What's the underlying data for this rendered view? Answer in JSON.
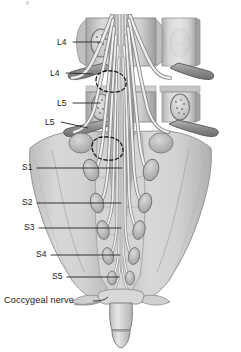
{
  "figure": {
    "type": "anatomical-diagram",
    "region": "lumbosacral spine",
    "background": "#ffffff"
  },
  "palette": {
    "bone_light": "#d2d2d2",
    "bone_mid": "#b9b9b9",
    "bone_dark": "#9a9a9a",
    "bone_shadow": "#7e7e7e",
    "nerve_light": "#efefef",
    "nerve_mid": "#cfcfcf",
    "outline": "#5e5e5e",
    "outline_dark": "#3c3c3c",
    "label_text": "#1a1a1a",
    "leader_line": "#2b2b2b",
    "dashed_disc": "#161616"
  },
  "labels": [
    {
      "id": "l4-body",
      "text": "L4",
      "x": 57,
      "y": 38,
      "leader": {
        "x1": 73,
        "y1": 42,
        "x2": 101,
        "y2": 42
      }
    },
    {
      "id": "l4-nerve",
      "text": "L4",
      "x": 50,
      "y": 69,
      "leader": {
        "x1": 66,
        "y1": 73,
        "x2": 93,
        "y2": 74
      }
    },
    {
      "id": "l5-body",
      "text": "L5",
      "x": 57,
      "y": 99,
      "leader": {
        "x1": 73,
        "y1": 103,
        "x2": 100,
        "y2": 103
      }
    },
    {
      "id": "l5-nerve",
      "text": "L5",
      "x": 45,
      "y": 118,
      "leader": {
        "x1": 61,
        "y1": 122,
        "x2": 88,
        "y2": 128
      }
    },
    {
      "id": "s1",
      "text": "S1",
      "x": 22,
      "y": 163,
      "leader": {
        "x1": 37,
        "y1": 168,
        "x2": 122,
        "y2": 168
      }
    },
    {
      "id": "s2",
      "text": "S2",
      "x": 22,
      "y": 198,
      "leader": {
        "x1": 37,
        "y1": 203,
        "x2": 121,
        "y2": 203
      }
    },
    {
      "id": "s3",
      "text": "S3",
      "x": 24,
      "y": 223,
      "leader": {
        "x1": 39,
        "y1": 228,
        "x2": 121,
        "y2": 228
      }
    },
    {
      "id": "s4",
      "text": "S4",
      "x": 36,
      "y": 250,
      "leader": {
        "x1": 51,
        "y1": 255,
        "x2": 120,
        "y2": 255
      }
    },
    {
      "id": "s5",
      "text": "S5",
      "x": 52,
      "y": 272,
      "leader": {
        "x1": 67,
        "y1": 277,
        "x2": 119,
        "y2": 277
      }
    },
    {
      "id": "coccygeal",
      "text": "Coccygeal nerve",
      "x": 4,
      "y": 297,
      "leader": null
    }
  ],
  "annotations": {
    "dashed_discs": [
      {
        "id": "disc-l4-l5",
        "label": "intervertebral disc L4/L5"
      },
      {
        "id": "disc-l5-s1",
        "label": "intervertebral disc L5/S1"
      }
    ]
  }
}
